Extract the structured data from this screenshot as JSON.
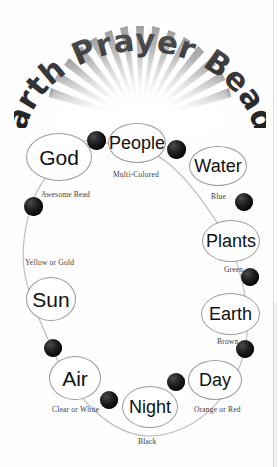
{
  "document": {
    "title": "Earth Prayer Beads",
    "title_words": [
      "Earth",
      "Prayer",
      "Beads"
    ],
    "background_color": "#ffffff",
    "bead_color": "#000000",
    "oval_outline_color": "#9a9a9a",
    "caption_color": "#3a3a3a"
  },
  "diagram": {
    "type": "prayer-bead-loop",
    "beads": [
      {
        "name": "God",
        "caption": "",
        "oval_size": "lg"
      },
      {
        "name": "People",
        "caption": "Multi-Colored",
        "oval_size": "md"
      },
      {
        "name": "Water",
        "caption": "Blue",
        "oval_size": "md"
      },
      {
        "name": "Plants",
        "caption": "Green",
        "oval_size": "md"
      },
      {
        "name": "Earth",
        "caption": "Brown",
        "oval_size": "md"
      },
      {
        "name": "Day",
        "caption": "Orange or Red",
        "oval_size": "md"
      },
      {
        "name": "Night",
        "caption": "Black",
        "oval_size": "md"
      },
      {
        "name": "Air",
        "caption": "Clear or White",
        "oval_size": "lg"
      },
      {
        "name": "Sun",
        "caption": "Yellow or Gold",
        "oval_size": "lg"
      }
    ],
    "marker_bead": {
      "label": "Awesome Bead"
    }
  }
}
